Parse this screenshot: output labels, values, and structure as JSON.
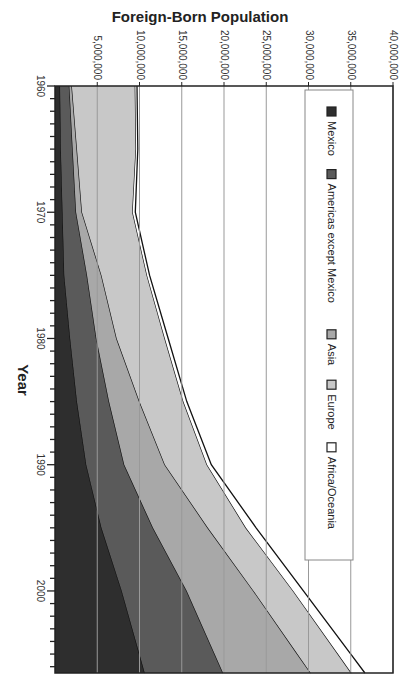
{
  "chart_data": {
    "type": "area",
    "stacked": true,
    "orientation": "rotated-90-clockwise",
    "title": "Foreign-Born Population",
    "xlabel": "Year",
    "ylabel": "",
    "x": [
      1960,
      1965,
      1970,
      1975,
      1980,
      1985,
      1990,
      1995,
      2000,
      2005
    ],
    "x_ticks": [
      "1960",
      "1970",
      "1980",
      "1990",
      "2000"
    ],
    "ylim": [
      0,
      40000000
    ],
    "y_ticks": [
      "5,000,000",
      "10,000,000",
      "15,000,000",
      "20,000,000",
      "25,000,000",
      "30,000,000",
      "35,000,000",
      "40,000,000"
    ],
    "grid": true,
    "legend_position": "inside-right",
    "series": [
      {
        "name": "Mexico",
        "color": "#2e2e2e",
        "values": [
          600000,
          700000,
          900000,
          1100000,
          1800000,
          2600000,
          3700000,
          5500000,
          7900000,
          10000000
        ]
      },
      {
        "name": "Americas except Mexico",
        "color": "#5a5a5a",
        "values": [
          1100000,
          1400000,
          1600000,
          2700000,
          3100000,
          3800000,
          4500000,
          6100000,
          7700000,
          8900000
        ]
      },
      {
        "name": "Asia",
        "color": "#a8a8a8",
        "values": [
          300000,
          500000,
          700000,
          1700000,
          2400000,
          3600000,
          4800000,
          6500000,
          7900000,
          9800000
        ]
      },
      {
        "name": "Europe",
        "color": "#c8c8c8",
        "values": [
          7500000,
          7000000,
          6000000,
          5400000,
          5700000,
          5200000,
          5000000,
          4500000,
          4700000,
          4800000
        ]
      },
      {
        "name": "Africa/Oceania",
        "color": "#ffffff",
        "values": [
          200000,
          200000,
          300000,
          300000,
          400000,
          400000,
          500000,
          1200000,
          1200000,
          1500000
        ]
      }
    ]
  },
  "legend": {
    "items": [
      {
        "label": "Mexico",
        "color": "#2e2e2e"
      },
      {
        "label": "Americas except Mexico",
        "color": "#5a5a5a"
      },
      {
        "label": "Asia",
        "color": "#a8a8a8"
      },
      {
        "label": "Europe",
        "color": "#c8c8c8"
      },
      {
        "label": "Africa/Oceania",
        "color": "#ffffff"
      }
    ]
  }
}
